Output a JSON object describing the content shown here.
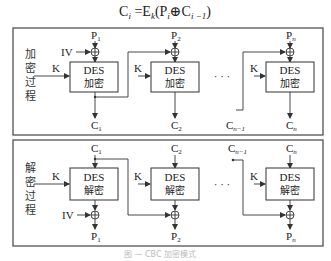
{
  "formula": {
    "lhs": "C",
    "lhs_sub": "i",
    "eq": " =E",
    "key_sub": "k",
    "open": "(P",
    "p_sub": "i",
    "xor": "⊕",
    "c": "C",
    "c_sub": "i −1",
    "close": ")"
  },
  "encryption": {
    "side_label": [
      "加",
      "密",
      "过",
      "程"
    ],
    "iv": "IV",
    "key": "K",
    "blocks": [
      {
        "input": "P",
        "input_sub": "1",
        "box_line1": "DES",
        "box_line2": "加密",
        "output": "C",
        "output_sub": "1"
      },
      {
        "input": "P",
        "input_sub": "2",
        "box_line1": "DES",
        "box_line2": "加密",
        "output": "C",
        "output_sub": "2"
      },
      {
        "input": "P",
        "input_sub": "n",
        "box_line1": "DES",
        "box_line2": "加密",
        "output": "C",
        "output_sub": "n"
      }
    ],
    "prev_cipher": "C",
    "prev_cipher_sub": "n−1",
    "ellipsis": "· · ·"
  },
  "decryption": {
    "side_label": [
      "解",
      "密",
      "过",
      "程"
    ],
    "iv": "IV",
    "key": "K",
    "blocks": [
      {
        "input": "C",
        "input_sub": "1",
        "box_line1": "DES",
        "box_line2": "解密",
        "output": "P",
        "output_sub": "1"
      },
      {
        "input": "C",
        "input_sub": "2",
        "box_line1": "DES",
        "box_line2": "解密",
        "output": "P",
        "output_sub": "2"
      },
      {
        "input": "C",
        "input_sub": "n",
        "box_line1": "DES",
        "box_line2": "解密",
        "output": "P",
        "output_sub": "n"
      }
    ],
    "prev_cipher": "C",
    "prev_cipher_sub": "n−1",
    "ellipsis": "· · ·"
  },
  "caption": "图 — CBC 加密模式"
}
